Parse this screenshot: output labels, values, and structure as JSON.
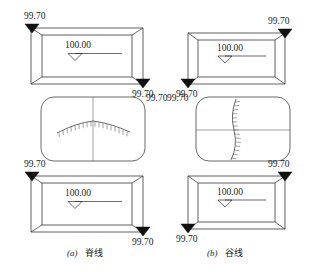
{
  "figure": {
    "title_caption_a": "(a) 脊线",
    "title_caption_b": "(b) 谷线",
    "caption_a_index": "(a)",
    "caption_a_label": "脊线",
    "caption_b_index": "(b)",
    "caption_b_label": "谷线",
    "background_color": "#ffffff",
    "line_color": "#2b2b2b",
    "marker_color": "#111111"
  },
  "panels": {
    "a": {
      "name": "ridge-line-panel",
      "caption_index": "(a)",
      "caption_label": "脊线",
      "top_block": {
        "name": "upper-contour-block",
        "water_level_value": "100.00",
        "benchmark_top_left": "99.70",
        "benchmark_bottom_right": "99.70"
      },
      "middle_plan": {
        "name": "ridge-plan-view",
        "feature": "ridge",
        "hachure_direction": "down",
        "curve_shape": "convex-up-arc",
        "section_line_orientation": "vertical"
      },
      "bottom_block": {
        "name": "lower-contour-block",
        "water_level_value": "100.00",
        "benchmark_top_left": "99.70",
        "benchmark_bottom_right": "99.70"
      }
    },
    "b": {
      "name": "valley-line-panel",
      "caption_index": "(b)",
      "caption_label": "谷线",
      "top_block": {
        "name": "upper-contour-block",
        "water_level_value": "100.00",
        "benchmark_top_right": "99.70",
        "benchmark_bottom_left": "99.70"
      },
      "middle_plan": {
        "name": "valley-plan-view",
        "feature": "valley",
        "hachure_direction": "right",
        "curve_shape": "vertical-sinuous",
        "section_line_orientation": "horizontal"
      },
      "bottom_block": {
        "name": "lower-contour-block",
        "water_level_value": "100.00",
        "benchmark_top_right": "99.70",
        "benchmark_bottom_left": "99.70"
      }
    }
  },
  "values": {
    "elevation_high": "100.00",
    "elevation_low": "99.70"
  }
}
